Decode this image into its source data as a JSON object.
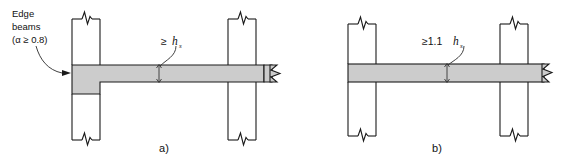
{
  "figure": {
    "background_color": "#ffffff",
    "line_color": "#1a1a1a",
    "slab_fill_color": "#cccccc"
  },
  "panel_a": {
    "caption": "a)",
    "callout": {
      "line1": "Edge",
      "line2": "beams",
      "line3": "(α ≥ 0.8)"
    },
    "dimension": {
      "prefix": "≥",
      "symbol": "h",
      "subscript": "s",
      "full": "≥ hₛ"
    }
  },
  "panel_b": {
    "caption": "b)",
    "dimension": {
      "prefix": "≥1.1",
      "symbol": "h",
      "subscript": "s",
      "full": "≥1.1hₛ"
    }
  }
}
